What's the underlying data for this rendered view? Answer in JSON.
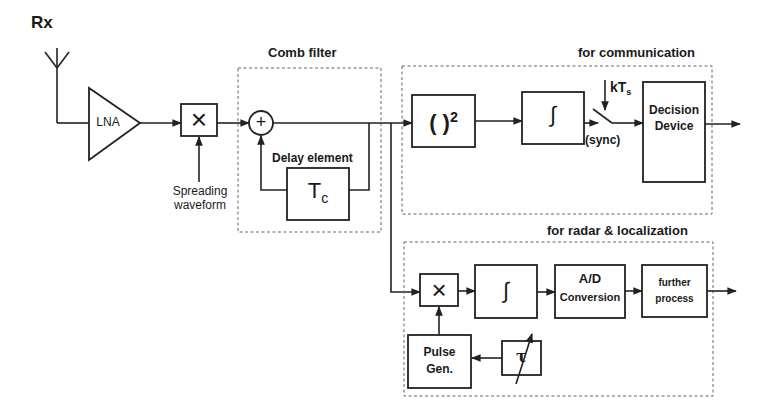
{
  "title": "Rx",
  "blocks": {
    "lna": "LNA",
    "mixer_symbol": "×",
    "spreading_waveform": [
      "Spreading",
      "waveform"
    ],
    "comb_filter_title": "Comb filter",
    "adder_symbol": "+",
    "delay_element_label": "Delay element",
    "delay_symbol": "T",
    "delay_subscript": "c",
    "comm_title": "for communication",
    "squarer": "( )",
    "squarer_exp": "2",
    "integrator_symbol": "∫",
    "sample_clock": "kT",
    "sample_clock_sub": "s",
    "sync_label": "(sync)",
    "decision_device": [
      "Decision",
      "Device"
    ],
    "radar_title": "for radar & localization",
    "radar_mixer_symbol": "×",
    "radar_integrator_symbol": "∫",
    "ad_conversion": [
      "A/D",
      "Conversion"
    ],
    "further_process": [
      "further",
      "process"
    ],
    "pulse_gen": [
      "Pulse",
      "Gen."
    ],
    "tau": "τ"
  },
  "colors": {
    "stroke": "#222222",
    "dashed": "#666666",
    "background": "#ffffff"
  }
}
